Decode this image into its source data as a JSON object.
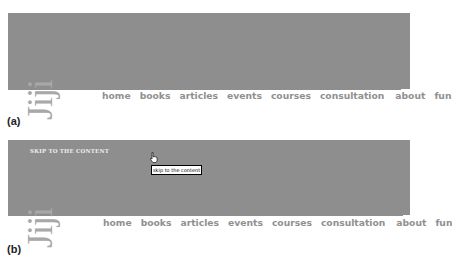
{
  "panels": [
    {
      "caption": "(a)",
      "logo_text": "Jiji",
      "nav": [
        "home",
        "books",
        "articles",
        "events",
        "courses",
        "consultation",
        "about",
        "fun"
      ]
    },
    {
      "caption": "(b)",
      "logo_text": "Jiji",
      "skip_link": "SKIP TO THE CONTENT",
      "tooltip": "skip to the content",
      "cursor_icon": "hand-pointer-icon",
      "nav": [
        "home",
        "books",
        "articles",
        "events",
        "courses",
        "consultation",
        "about",
        "fun"
      ]
    }
  ],
  "colors": {
    "banner": "#8e8e8e",
    "nav_text": "#909090",
    "skip_text": "#eeeeee"
  }
}
